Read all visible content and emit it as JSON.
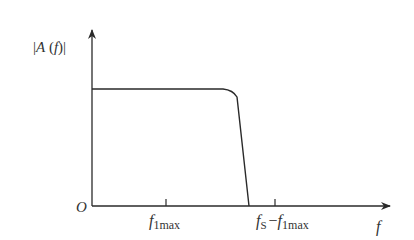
{
  "diagram": {
    "type": "frequency-response-sketch",
    "y_axis_label": {
      "prefix": "|",
      "A": "A",
      "open": " (",
      "f": "f",
      "close": ")|"
    },
    "origin_label": "O",
    "x_axis_label": "f",
    "ticks": [
      {
        "name": "f_1max",
        "main": "f",
        "sub": "1max"
      },
      {
        "name": "fs_minus_f_1max",
        "main1": "f",
        "sub1": "S",
        "minus": "−",
        "main2": "f",
        "sub2": "1max"
      }
    ],
    "curve": "flat passband then steep roll-off to zero before fs − f1max",
    "colors": {
      "line": "#2a2a2a",
      "text": "#333333",
      "background": "#ffffff"
    }
  }
}
